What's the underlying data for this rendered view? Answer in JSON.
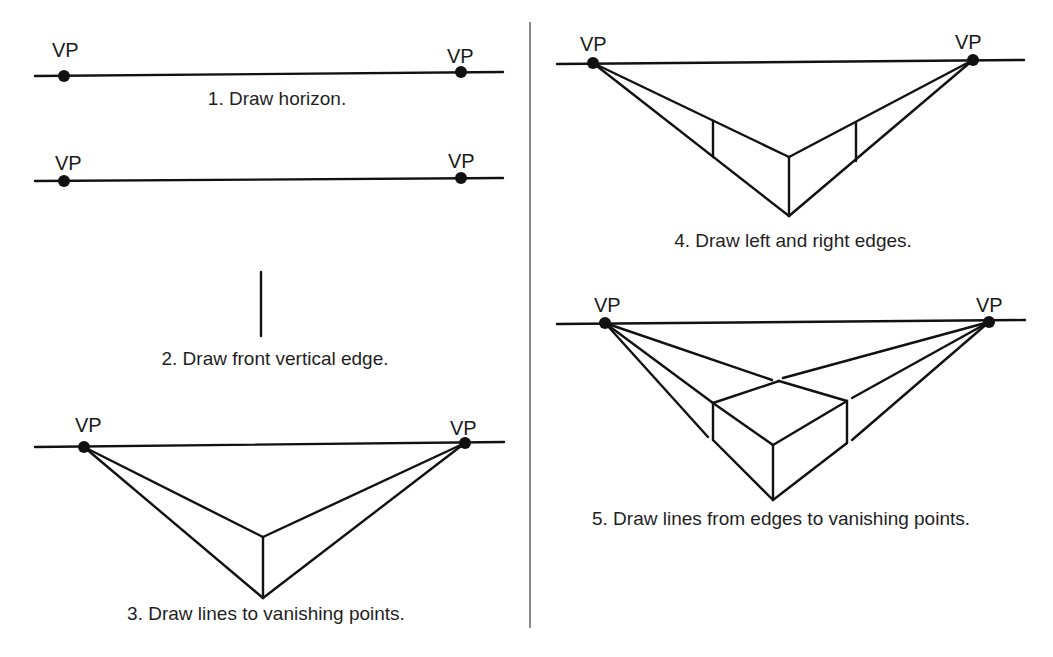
{
  "vp_label": "VP",
  "colors": {
    "ink": "#111111",
    "divider": "#8a8a8a",
    "background": "#ffffff"
  },
  "steps": [
    {
      "number": 1,
      "caption": "1. Draw horizon."
    },
    {
      "number": 2,
      "caption": "2. Draw front vertical edge."
    },
    {
      "number": 3,
      "caption": "3. Draw lines to vanishing points."
    },
    {
      "number": 4,
      "caption": "4. Draw left and right edges."
    },
    {
      "number": 5,
      "caption": "5. Draw lines from edges to vanishing points."
    }
  ],
  "labels": {
    "p1_vp_left": "VP",
    "p1_vp_right": "VP",
    "p2_vp_left": "VP",
    "p2_vp_right": "VP",
    "p3_vp_left": "VP",
    "p3_vp_right": "VP",
    "p4_vp_left": "VP",
    "p4_vp_right": "VP",
    "p5_vp_left": "VP",
    "p5_vp_right": "VP"
  }
}
